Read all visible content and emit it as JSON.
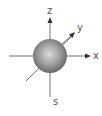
{
  "diagram": {
    "axes": {
      "z_label": "z",
      "y_label": "y",
      "x_label": "x"
    },
    "orbital_label": "s",
    "colors": {
      "axis": "#6a6a6a",
      "sphere_light": "#d8d8d8",
      "sphere_dark": "#5a5a5a",
      "label": "#555555"
    }
  }
}
